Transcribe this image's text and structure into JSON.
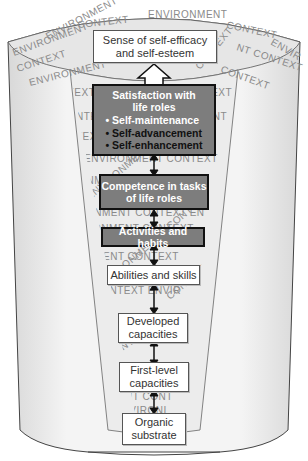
{
  "diagram": {
    "context_words": [
      "ENVIRONMENT",
      "CONTEXT"
    ],
    "colors": {
      "dark_box_fill": "#7d7d7d",
      "dark_box_border": "#111111",
      "light_box_fill": "#ffffff",
      "funnel_fill": "#f0f0f0",
      "context_text": "#8a8a8a"
    },
    "levels": [
      {
        "id": "self-efficacy",
        "line1": "Sense of self-efficacy",
        "line2": "and self-esteem",
        "style": "light"
      },
      {
        "id": "satisfaction",
        "line1": "Satisfaction with",
        "line2": "life roles",
        "style": "dark",
        "bullets": [
          {
            "text": "• Self-maintenance",
            "tone": "white"
          },
          {
            "text": "• Self-advancement",
            "tone": "dark"
          },
          {
            "text": "• Self-enhancement",
            "tone": "dark"
          }
        ]
      },
      {
        "id": "competence",
        "line1": "Competence in tasks",
        "line2": "of life roles",
        "style": "dark"
      },
      {
        "id": "activities",
        "line1": "Activities and habits",
        "style": "dark"
      },
      {
        "id": "abilities",
        "line1": "Abilities and skills",
        "style": "light"
      },
      {
        "id": "developed",
        "line1": "Developed",
        "line2": "capacities",
        "style": "light"
      },
      {
        "id": "first-level",
        "line1": "First-level",
        "line2": "capacities",
        "style": "light"
      },
      {
        "id": "organic",
        "line1": "Organic",
        "line2": "substrate",
        "style": "light"
      }
    ]
  }
}
